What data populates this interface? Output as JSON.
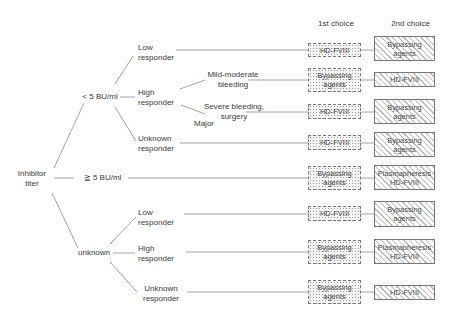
{
  "headers": {
    "first": "1st choice",
    "second": "2nd choice"
  },
  "root": {
    "line1": "Inhibitor",
    "line2": "titer"
  },
  "titers": {
    "low": "< 5 BU/ml",
    "high": "≧ 5 BU/ml",
    "unknown": "unknown"
  },
  "responders": {
    "low_low": {
      "line1": "Low",
      "line2": "responder"
    },
    "low_high": {
      "line1": "High",
      "line2": "responder"
    },
    "low_unknown": {
      "line1": "Unknown",
      "line2": "responder"
    },
    "unk_low": {
      "line1": "Low",
      "line2": "responder"
    },
    "unk_high": {
      "line1": "High",
      "line2": "responder"
    },
    "unk_unknown": {
      "line1": "Unknown",
      "line2": "responder"
    }
  },
  "bleeding": {
    "mild": {
      "line1": "Mild-moderate",
      "line2": "bleeding"
    },
    "severe": {
      "line1": "Severe bleeding,",
      "line2": "surgery"
    },
    "major": "Major"
  },
  "rows": [
    {
      "first": [
        "HD-FVIII"
      ],
      "second": [
        "Bypassing",
        "agents"
      ]
    },
    {
      "first": [
        "Bypassing",
        "agents"
      ],
      "second": [
        "HD-FVIII"
      ]
    },
    {
      "first": [
        "HD-FVIII"
      ],
      "second": [
        "Bypassing",
        "agents"
      ]
    },
    {
      "first": [
        "HD-FVIII"
      ],
      "second": [
        "Bypassing",
        "agents"
      ]
    },
    {
      "first": [
        "Bypassing",
        "agents"
      ],
      "second": [
        "Plasmapheresis",
        "HD-FVIII"
      ]
    },
    {
      "first": [
        "HD-FVIII"
      ],
      "second": [
        "Bypassing",
        "agents"
      ]
    },
    {
      "first": [
        "Bypassing",
        "agents"
      ],
      "second": [
        "Plasmapheresis",
        "HD-FVIII"
      ]
    },
    {
      "first": [
        "Bypassing",
        "agents"
      ],
      "second": [
        "HD-FVIII"
      ]
    }
  ],
  "colors": {
    "line": "#8a8a8a",
    "border": "#777777",
    "text": "#3a3a3a"
  }
}
